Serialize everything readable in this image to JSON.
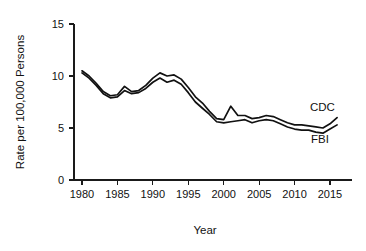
{
  "chart_data": {
    "type": "line",
    "title": "",
    "xlabel": "Year",
    "ylabel": "Rate per 100,000 Persons",
    "xlim": [
      1979,
      2017
    ],
    "ylim": [
      0,
      15
    ],
    "grid": false,
    "legend_position": "inline-right",
    "x_ticks": [
      "1980",
      "1985",
      "1990",
      "1995",
      "2000",
      "2005",
      "2010",
      "2015"
    ],
    "y_ticks": [
      "0",
      "5",
      "10",
      "15"
    ],
    "x": [
      1980,
      1981,
      1982,
      1983,
      1984,
      1985,
      1986,
      1987,
      1988,
      1989,
      1990,
      1991,
      1992,
      1993,
      1994,
      1995,
      1996,
      1997,
      1998,
      1999,
      2000,
      2001,
      2002,
      2003,
      2004,
      2005,
      2006,
      2007,
      2008,
      2009,
      2010,
      2011,
      2012,
      2013,
      2014,
      2015,
      2016
    ],
    "series": [
      {
        "name": "CDC",
        "label": "CDC",
        "color": "#111111",
        "values": [
          10.5,
          10.0,
          9.3,
          8.5,
          8.1,
          8.2,
          9.0,
          8.5,
          8.6,
          9.1,
          9.8,
          10.3,
          10.0,
          10.1,
          9.7,
          8.9,
          8.0,
          7.4,
          6.6,
          5.9,
          5.8,
          7.1,
          6.2,
          6.2,
          5.9,
          6.0,
          6.2,
          6.1,
          5.8,
          5.5,
          5.3,
          5.3,
          5.2,
          5.1,
          5.0,
          5.4,
          6.0
        ]
      },
      {
        "name": "FBI",
        "label": "FBI",
        "color": "#111111",
        "values": [
          10.3,
          9.8,
          9.1,
          8.3,
          7.9,
          8.0,
          8.6,
          8.3,
          8.4,
          8.8,
          9.4,
          9.8,
          9.4,
          9.6,
          9.2,
          8.4,
          7.5,
          6.9,
          6.3,
          5.6,
          5.5,
          5.6,
          5.7,
          5.8,
          5.5,
          5.7,
          5.8,
          5.7,
          5.4,
          5.1,
          4.9,
          4.8,
          4.8,
          4.6,
          4.5,
          4.9,
          5.3
        ]
      }
    ]
  },
  "axes": {
    "y_label": "Rate per 100,000 Persons",
    "x_label": "Year"
  }
}
